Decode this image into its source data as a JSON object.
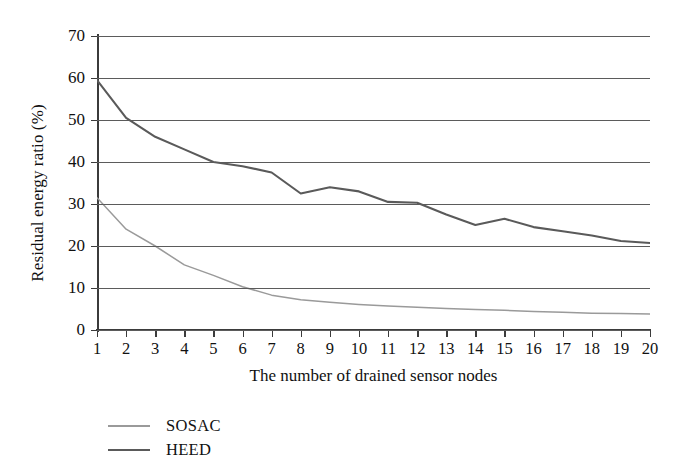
{
  "chart_data": {
    "type": "line",
    "title": "",
    "xlabel": "The number of drained sensor nodes",
    "ylabel": "Residual energy ratio (%)",
    "x": [
      1,
      2,
      3,
      4,
      5,
      6,
      7,
      8,
      9,
      10,
      11,
      12,
      13,
      14,
      15,
      16,
      17,
      18,
      19,
      20
    ],
    "xtick_labels": [
      "1",
      "2",
      "3",
      "4",
      "5",
      "6",
      "7",
      "8",
      "9",
      "10",
      "11",
      "12",
      "13",
      "14",
      "15",
      "16",
      "17",
      "18",
      "19",
      "20"
    ],
    "ytick_labels": [
      "0",
      "10",
      "20",
      "30",
      "40",
      "50",
      "60",
      "70"
    ],
    "yticks": [
      0,
      10,
      20,
      30,
      40,
      50,
      60,
      70
    ],
    "xlim": [
      1,
      20
    ],
    "ylim": [
      0,
      70
    ],
    "grid": "horizontal",
    "legend_position": "below-axis-left",
    "series": [
      {
        "name": "SOSAC",
        "color": "#9a9a9a",
        "values": [
          31.5,
          24.0,
          20.0,
          15.5,
          13.0,
          10.3,
          8.3,
          7.2,
          6.6,
          6.1,
          5.7,
          5.4,
          5.1,
          4.9,
          4.7,
          4.4,
          4.2,
          4.0,
          3.9,
          3.8
        ]
      },
      {
        "name": "HEED",
        "color": "#5a5a5a",
        "values": [
          59.5,
          50.5,
          46.0,
          43.0,
          40.0,
          39.0,
          37.5,
          32.5,
          34.0,
          33.0,
          30.5,
          30.3,
          27.5,
          25.0,
          26.5,
          24.5,
          23.5,
          22.5,
          21.2,
          20.7
        ]
      }
    ]
  },
  "legend": {
    "items": [
      {
        "label": "SOSAC",
        "color": "#9a9a9a"
      },
      {
        "label": "HEED",
        "color": "#5a5a5a"
      }
    ]
  }
}
